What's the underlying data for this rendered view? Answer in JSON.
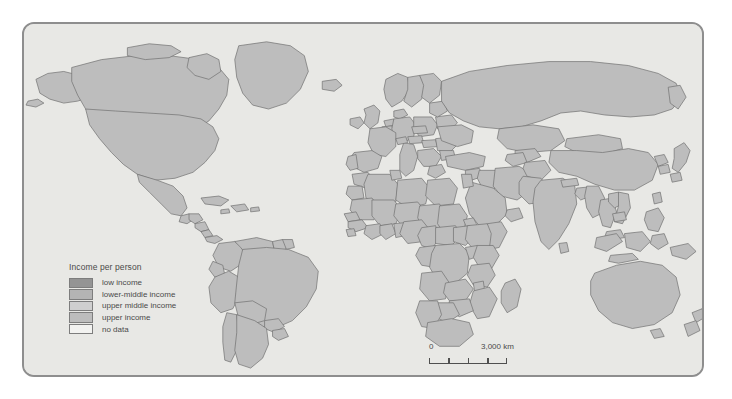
{
  "map": {
    "title": "Income per person",
    "projection_background": "#e8e8e5",
    "frame_border_color": "#8e8e8e",
    "legend": {
      "title": "Income per person",
      "items": [
        {
          "label": "low income",
          "color": "#949494"
        },
        {
          "label": "lower-middle income",
          "color": "#b4b4b4"
        },
        {
          "label": "upper middle income",
          "color": "#cfcfcf"
        },
        {
          "label": "upper income",
          "color": "#bdbdbd"
        },
        {
          "label": "no data",
          "color": "#f2f2f0"
        }
      ]
    },
    "scalebar": {
      "zero_label": "0",
      "max_label": "3,000 km",
      "segments": 4
    }
  }
}
